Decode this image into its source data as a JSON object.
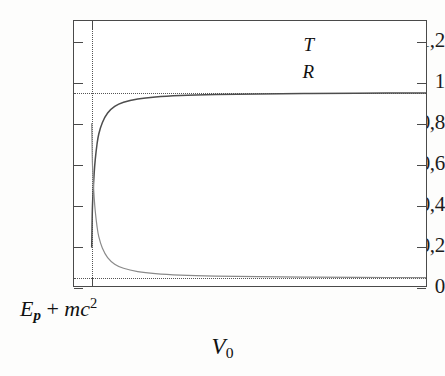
{
  "chart_data": {
    "type": "line",
    "title": "",
    "xlabel": "V0",
    "ylabel": "",
    "xlabel_display": "V₀",
    "ylim": [
      0,
      1.3
    ],
    "xlim": [
      0,
      1
    ],
    "grid": false,
    "legend_position": "top-right",
    "y_ticks": [
      {
        "value": 0,
        "label": "0"
      },
      {
        "value": 0.2,
        "label": "0,2"
      },
      {
        "value": 0.4,
        "label": "0,4"
      },
      {
        "value": 0.6,
        "label": "0,6"
      },
      {
        "value": 0.8,
        "label": "0,8"
      },
      {
        "value": 1.0,
        "label": "1"
      },
      {
        "value": 1.2,
        "label": "1,2"
      }
    ],
    "x_ticks": [
      {
        "value": 0.05,
        "label": "Ep + mc2",
        "label_display": "E_p + mc²"
      }
    ],
    "guides": [
      {
        "orientation": "horizontal",
        "value": 0.95,
        "style": "dotted"
      },
      {
        "orientation": "horizontal",
        "value": 0.05,
        "style": "dotted"
      },
      {
        "orientation": "vertical",
        "value": 0.05,
        "style": "dotted"
      }
    ],
    "series": [
      {
        "name": "T",
        "color": "#4d4d4d",
        "width": 1.5,
        "asymptote": 0.95,
        "description": "Transmission coefficient rising steeply from ~0.2 at threshold, crossing ~0.5, then saturating at 0.95",
        "x": [
          0.05,
          0.051,
          0.052,
          0.054,
          0.057,
          0.06,
          0.065,
          0.07,
          0.08,
          0.095,
          0.115,
          0.14,
          0.18,
          0.23,
          0.3,
          0.4,
          0.52,
          0.65,
          0.8,
          1.0
        ],
        "y": [
          0.2,
          0.3,
          0.39,
          0.47,
          0.56,
          0.625,
          0.7,
          0.75,
          0.805,
          0.852,
          0.884,
          0.904,
          0.92,
          0.93,
          0.937,
          0.942,
          0.945,
          0.947,
          0.948,
          0.95
        ]
      },
      {
        "name": "R",
        "color": "#8a8a8a",
        "width": 1.2,
        "asymptote": 0.05,
        "description": "Reflection coefficient falling steeply from ~0.8 at threshold, crossing ~0.5, then saturating at 0.05",
        "x": [
          0.05,
          0.051,
          0.052,
          0.054,
          0.057,
          0.06,
          0.065,
          0.07,
          0.08,
          0.095,
          0.115,
          0.14,
          0.18,
          0.23,
          0.3,
          0.4,
          0.52,
          0.65,
          0.8,
          1.0
        ],
        "y": [
          0.8,
          0.7,
          0.61,
          0.53,
          0.44,
          0.375,
          0.3,
          0.25,
          0.195,
          0.148,
          0.116,
          0.096,
          0.08,
          0.07,
          0.063,
          0.058,
          0.055,
          0.053,
          0.052,
          0.05
        ]
      }
    ]
  },
  "legend": {
    "entries": [
      {
        "label": "T",
        "name": "transmission"
      },
      {
        "label": "R",
        "name": "reflection"
      }
    ]
  },
  "axis_annotations": {
    "x_threshold_parts": {
      "E": "E",
      "p": "p",
      "plus": " + ",
      "mc": "mc",
      "exp": "2"
    },
    "x_title_parts": {
      "V": "V",
      "zero": "0"
    }
  },
  "colors": {
    "frame": "#4a4a4a",
    "guide": "#555555",
    "series_T": "#4d4d4d",
    "series_R": "#8a8a8a",
    "text": "#1c1c1c",
    "background": "#ffffff"
  }
}
